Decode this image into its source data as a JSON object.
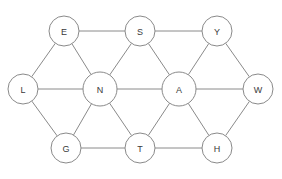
{
  "diagram": {
    "type": "undirected-graph",
    "title": "",
    "layout": "triangular-lattice",
    "canvas": {
      "width": 282,
      "height": 179
    },
    "style": {
      "background_color": "#ffffff",
      "edge_color": "#8a8a8a",
      "edge_width": 1,
      "node_fill": "#ffffff",
      "node_stroke": "#8a8a8a",
      "node_stroke_width": 1,
      "node_radius": 15,
      "label_color": "#3a3a3a",
      "label_font_size": 9
    },
    "nodes": [
      {
        "id": "E",
        "label": "E",
        "x": 64,
        "y": 31,
        "r": 15
      },
      {
        "id": "S",
        "label": "S",
        "x": 140,
        "y": 31,
        "r": 15
      },
      {
        "id": "Y",
        "label": "Y",
        "x": 217,
        "y": 31,
        "r": 15
      },
      {
        "id": "L",
        "label": "L",
        "x": 23,
        "y": 89,
        "r": 15
      },
      {
        "id": "N",
        "label": "N",
        "x": 100,
        "y": 89,
        "r": 17
      },
      {
        "id": "A",
        "label": "A",
        "x": 179,
        "y": 89,
        "r": 17
      },
      {
        "id": "W",
        "label": "W",
        "x": 258,
        "y": 89,
        "r": 15
      },
      {
        "id": "G",
        "label": "G",
        "x": 66,
        "y": 148,
        "r": 15
      },
      {
        "id": "T",
        "label": "T",
        "x": 140,
        "y": 148,
        "r": 15
      },
      {
        "id": "H",
        "label": "H",
        "x": 217,
        "y": 148,
        "r": 15
      }
    ],
    "edges": [
      {
        "source": "E",
        "target": "S"
      },
      {
        "source": "S",
        "target": "Y"
      },
      {
        "source": "E",
        "target": "L"
      },
      {
        "source": "E",
        "target": "N"
      },
      {
        "source": "S",
        "target": "N"
      },
      {
        "source": "S",
        "target": "A"
      },
      {
        "source": "Y",
        "target": "A"
      },
      {
        "source": "Y",
        "target": "W"
      },
      {
        "source": "L",
        "target": "N"
      },
      {
        "source": "N",
        "target": "A"
      },
      {
        "source": "A",
        "target": "W"
      },
      {
        "source": "L",
        "target": "G"
      },
      {
        "source": "N",
        "target": "G"
      },
      {
        "source": "N",
        "target": "T"
      },
      {
        "source": "A",
        "target": "T"
      },
      {
        "source": "A",
        "target": "H"
      },
      {
        "source": "W",
        "target": "H"
      },
      {
        "source": "G",
        "target": "T"
      },
      {
        "source": "T",
        "target": "H"
      }
    ],
    "node_count": 10,
    "edge_count": 19
  }
}
